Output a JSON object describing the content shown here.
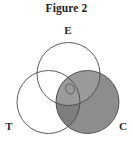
{
  "figure": {
    "title": "Figure 2",
    "caption_position": "top"
  },
  "diagram": {
    "type": "venn-3-circle",
    "background_color": "#ffffff",
    "stroke_color": "#4a4a4a",
    "stroke_width": 0.9,
    "shaded_fill": "#8d8d8d",
    "shaded_overlap_fill": "#7e7e7e",
    "unshaded_fill": "#ffffff",
    "circles": [
      {
        "id": "E",
        "label": "E",
        "label_x": 68,
        "label_y": 16,
        "cx": 68.5,
        "cy": 56,
        "r": 31.5,
        "shaded": false
      },
      {
        "id": "T",
        "label": "T",
        "label_x": 9,
        "label_y": 112,
        "cx": 48.5,
        "cy": 84,
        "r": 31.5,
        "shaded": false
      },
      {
        "id": "C",
        "label": "C",
        "label_x": 123,
        "label_y": 112,
        "cx": 87.5,
        "cy": 84,
        "r": 31.5,
        "shaded": true
      }
    ],
    "center_marker": {
      "id": "center-region-marker",
      "shape": "ellipse",
      "cx": 70,
      "cy": 71,
      "rx": 4.2,
      "ry": 5.2,
      "rotation": -20,
      "stroke_color": "#5a5a5a",
      "fill": "none"
    }
  }
}
